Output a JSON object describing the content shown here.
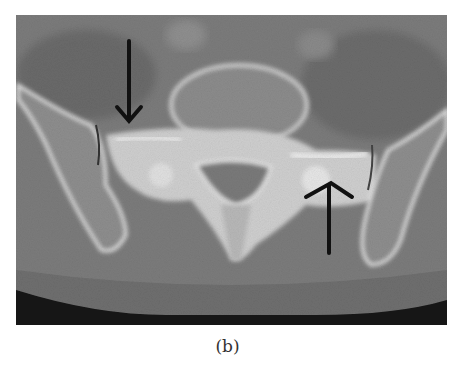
{
  "figure": {
    "type": "axial CT scan of pelvis (sacroiliac joints)",
    "caption": "(b)",
    "annotations": [
      {
        "name": "arrow-down",
        "direction": "down",
        "position": "upper-left, over left sacroiliac region"
      },
      {
        "name": "arrow-up",
        "direction": "up",
        "position": "lower-right, under right sacroiliac region"
      }
    ],
    "colors": {
      "background_tissue": "#7a7a7a",
      "bone": "#e6e6e6",
      "air": "#151515",
      "arrow": "#111111"
    }
  }
}
